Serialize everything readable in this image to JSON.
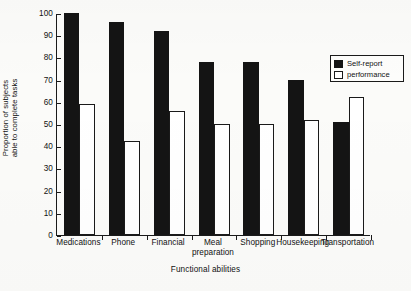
{
  "chart_data": {
    "type": "bar",
    "title": "",
    "xlabel": "Functional abilities",
    "ylabel": "Proportion of subjects able to complete tasks",
    "ylabel_line1": "Proportion of subjects",
    "ylabel_line2": "able to complete tasks",
    "categories": [
      "Medications",
      "Phone",
      "Financial",
      "Meal preparation",
      "Shopping",
      "Housekeeping",
      "Transportation"
    ],
    "category_lines": [
      [
        "Medications"
      ],
      [
        "Phone"
      ],
      [
        "Financial"
      ],
      [
        "Meal",
        "preparation"
      ],
      [
        "Shopping"
      ],
      [
        "Housekeeping"
      ],
      [
        "Transportation"
      ]
    ],
    "series": [
      {
        "name": "Self-report",
        "color": "#141414",
        "fill": "solid",
        "values": [
          100,
          96,
          92,
          78,
          78,
          70,
          51
        ]
      },
      {
        "name": "performance",
        "color": "#ffffff",
        "fill": "open",
        "values": [
          59,
          42.5,
          56,
          50,
          50,
          52,
          62
        ]
      }
    ],
    "ylim": [
      0,
      100
    ],
    "ytick_values": [
      0,
      10,
      20,
      30,
      40,
      50,
      60,
      70,
      80,
      90,
      100
    ],
    "ytick_labels": [
      "0",
      "10",
      "20",
      "30",
      "40",
      "50",
      "60",
      "70",
      "80",
      "90",
      "100"
    ],
    "grid": false,
    "legend_position": "upper-right",
    "axis_style": "left-bottom-only",
    "tick_direction": "inward"
  },
  "legend": {
    "entries": [
      {
        "label": "Self-report",
        "swatch": "filled-black"
      },
      {
        "label": "performance",
        "swatch": "open-white"
      }
    ]
  }
}
